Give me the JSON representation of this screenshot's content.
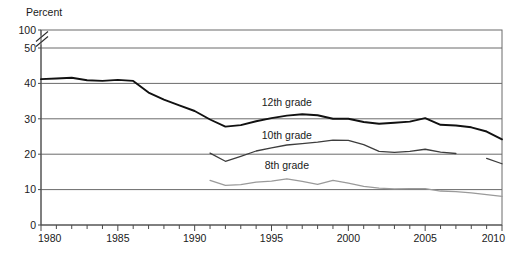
{
  "chart_data": {
    "type": "line",
    "title": "",
    "subtitle": "",
    "xlabel": "",
    "ylabel": "Percent",
    "grid": true,
    "legend_position": "inline-labels",
    "axis_break": {
      "between": [
        50,
        100
      ],
      "symbol": "//"
    },
    "xlim": [
      1980,
      2010
    ],
    "ylim": [
      0,
      50
    ],
    "xticks_major": [
      1980,
      1985,
      1990,
      1995,
      2000,
      2005,
      2010
    ],
    "xtick_labels": [
      "1980",
      "1985",
      "1990",
      "1995",
      "2000",
      "2005",
      "2010"
    ],
    "xticks_minor_step": 1,
    "yticks": [
      0,
      10,
      20,
      30,
      40,
      50,
      100
    ],
    "ytick_labels": [
      "0",
      "10",
      "20",
      "30",
      "40",
      "50",
      "100"
    ],
    "series": [
      {
        "name": "12th grade",
        "color": "#111111",
        "label_x": 1996.0,
        "label_y": 33.6,
        "x": [
          1980,
          1981,
          1982,
          1983,
          1984,
          1985,
          1986,
          1987,
          1988,
          1989,
          1990,
          1991,
          1992,
          1993,
          1994,
          1995,
          1996,
          1997,
          1998,
          1999,
          2000,
          2001,
          2002,
          2003,
          2004,
          2005,
          2006,
          2007,
          2008,
          2009,
          2010
        ],
        "values": [
          41.2,
          41.4,
          41.6,
          40.9,
          40.7,
          41.0,
          40.7,
          37.4,
          35.4,
          33.8,
          32.2,
          29.8,
          27.8,
          28.2,
          29.3,
          30.2,
          30.9,
          31.3,
          31.0,
          30.0,
          30.0,
          29.1,
          28.6,
          28.9,
          29.2,
          30.2,
          28.3,
          28.1,
          27.6,
          26.4,
          24.2
        ]
      },
      {
        "name": "10th grade",
        "color": "#3d3d3d",
        "label_x": 1996.0,
        "label_y": 24.2,
        "x": [
          1991,
          1992,
          1993,
          1994,
          1995,
          1996,
          1997,
          1998,
          1999,
          2000,
          2001,
          2002,
          2003,
          2004,
          2005,
          2006,
          2007
        ],
        "values": [
          20.3,
          18.0,
          19.4,
          20.9,
          21.8,
          22.6,
          23.0,
          23.4,
          24.0,
          23.9,
          22.7,
          20.8,
          20.5,
          20.8,
          21.4,
          20.6,
          20.2
        ]
      },
      {
        "name": "10th grade (break segment)",
        "color": "#3d3d3d",
        "parent": "10th grade",
        "x": [
          2009,
          2010
        ],
        "values": [
          18.8,
          17.3
        ]
      },
      {
        "name": "8th grade",
        "color": "#9a9a9a",
        "label_x": 1996.0,
        "label_y": 15.8,
        "x": [
          1991,
          1992,
          1993,
          1994,
          1995,
          1996,
          1997,
          1998,
          1999,
          2000,
          2001,
          2002,
          2003,
          2004,
          2005,
          2006,
          2007,
          2008,
          2009,
          2010
        ],
        "values": [
          12.6,
          11.2,
          11.4,
          12.1,
          12.4,
          13.0,
          12.3,
          11.5,
          12.6,
          11.8,
          10.9,
          10.4,
          10.2,
          10.3,
          10.3,
          9.6,
          9.4,
          9.1,
          8.6,
          8.1
        ]
      }
    ]
  },
  "axis": {
    "unit_label": "Percent"
  }
}
